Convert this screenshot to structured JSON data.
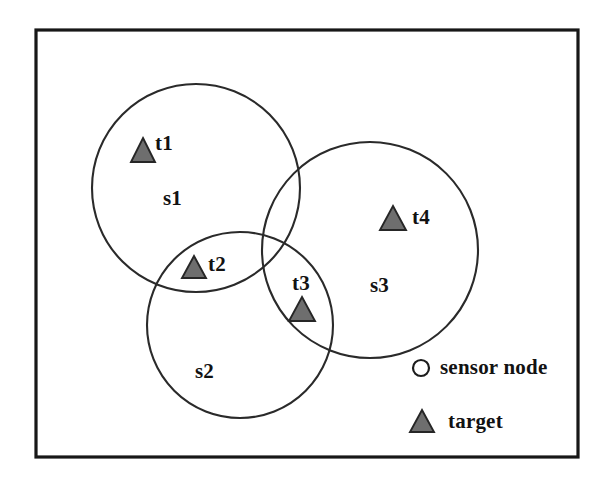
{
  "figure": {
    "kind": "venn-style sensor coverage diagram",
    "background_color": "#ffffff",
    "frame": {
      "name": "outer-frame",
      "x": 36,
      "y": 30,
      "width": 542,
      "height": 427,
      "stroke_color": "#171717"
    },
    "sensors": [
      {
        "id": "s1",
        "label": "s1",
        "cx": 196,
        "cy": 188,
        "r": 104,
        "label_x": 163,
        "label_y": 188
      },
      {
        "id": "s2",
        "label": "s2",
        "cx": 240,
        "cy": 325,
        "r": 93,
        "label_x": 195,
        "label_y": 361
      },
      {
        "id": "s3",
        "label": "s3",
        "cx": 370,
        "cy": 250,
        "r": 108,
        "label_x": 370,
        "label_y": 275
      }
    ],
    "targets": [
      {
        "id": "t1",
        "label": "t1",
        "cx": 143,
        "cy": 150,
        "size": 24,
        "label_x": 155,
        "label_y": 133,
        "inside": [
          "s1"
        ]
      },
      {
        "id": "t2",
        "label": "t2",
        "cx": 194,
        "cy": 267,
        "size": 23,
        "label_x": 208,
        "label_y": 254,
        "inside": [
          "s1",
          "s2"
        ]
      },
      {
        "id": "t3",
        "label": "t3",
        "cx": 302,
        "cy": 309,
        "size": 25,
        "label_x": 292,
        "label_y": 273,
        "inside": [
          "s2",
          "s3"
        ]
      },
      {
        "id": "t4",
        "label": "t4",
        "cx": 393,
        "cy": 218,
        "size": 25,
        "label_x": 412,
        "label_y": 207,
        "inside": [
          "s3"
        ]
      }
    ],
    "legend": {
      "items": [
        {
          "id": "sensor-node",
          "marker": "circle-outline",
          "label": "sensor node",
          "marker_cx": 421,
          "marker_cy": 368,
          "marker_r": 8,
          "label_x": 440,
          "label_y": 357
        },
        {
          "id": "target",
          "marker": "filled-triangle",
          "label": "target",
          "marker_cx": 422,
          "marker_cy": 421,
          "marker_size": 23,
          "label_x": 448,
          "label_y": 411
        }
      ]
    },
    "colors": {
      "frame_stroke": "#171717",
      "circle_stroke": "#2a2a2a",
      "triangle_fill": "#6e6e6e",
      "triangle_stroke": "#262626",
      "text": "#121212",
      "background": "#ffffff"
    }
  }
}
